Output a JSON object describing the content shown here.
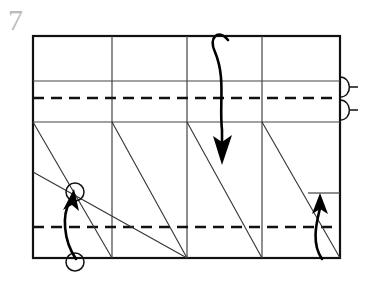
{
  "figure": {
    "step_number": "7",
    "canvas": {
      "width": 371,
      "height": 294,
      "background": "#ffffff"
    }
  },
  "colors": {
    "outline": "#111111",
    "crease_solid": "#444444",
    "crease_dashed": "#111111",
    "arrow": "#000000",
    "step_number": "#b9b9b9",
    "paper_fill": "#ffffff"
  },
  "paper": {
    "label": "paper-outline",
    "x": 33,
    "y": 36,
    "width": 307,
    "height": 222,
    "stroke_width": 2.2
  },
  "vertical_creases": {
    "label": "vertical-crease-lines",
    "x_positions": [
      112,
      187,
      262
    ],
    "y_top": 36,
    "y_bottom": 258,
    "stroke_width": 1.2
  },
  "horizontal_creases": [
    {
      "name": "upper-solid-crease",
      "y": 81,
      "x1": 33,
      "x2": 340,
      "style": "solid",
      "stroke_width": 1.2
    },
    {
      "name": "upper-dashed-crease",
      "y": 98,
      "x1": 33,
      "x2": 340,
      "style": "dashed",
      "stroke_width": 2.4,
      "dash": "10 7"
    },
    {
      "name": "lower-solid-crease",
      "y": 122,
      "x1": 33,
      "x2": 340,
      "style": "solid",
      "stroke_width": 1.2
    },
    {
      "name": "bottom-dashed-crease",
      "y": 227,
      "x1": 33,
      "x2": 340,
      "style": "dashed",
      "stroke_width": 2.4,
      "dash": "10 7"
    },
    {
      "name": "right-short-solid-crease",
      "y": 193,
      "x1": 308,
      "x2": 340,
      "style": "solid",
      "stroke_width": 1.2
    }
  ],
  "diagonal_creases": [
    {
      "name": "steep-diagonal-1",
      "x1": 33,
      "y1": 122,
      "x2": 112,
      "y2": 258
    },
    {
      "name": "steep-diagonal-2",
      "x1": 112,
      "y1": 122,
      "x2": 187,
      "y2": 258
    },
    {
      "name": "steep-diagonal-3",
      "x1": 187,
      "y1": 122,
      "x2": 262,
      "y2": 258
    },
    {
      "name": "steep-diagonal-4",
      "x1": 262,
      "y1": 122,
      "x2": 340,
      "y2": 258
    },
    {
      "name": "shallow-diagonal-left",
      "x1": 33,
      "y1": 172,
      "x2": 187,
      "y2": 258
    }
  ],
  "markers": {
    "reference_circles": [
      {
        "name": "reference-circle-upper",
        "cx": 75,
        "cy": 192,
        "r": 9
      },
      {
        "name": "reference-circle-lower",
        "cx": 75,
        "cy": 262,
        "r": 9
      }
    ],
    "pleat_hooks": [
      {
        "name": "pleat-hook-upper",
        "x": 340,
        "cy": 87,
        "rx": 9,
        "ry": 11,
        "tick_length": 7
      },
      {
        "name": "pleat-hook-lower",
        "x": 340,
        "cy": 110,
        "rx": 9,
        "ry": 11,
        "tick_length": 7
      }
    ]
  },
  "arrows": [
    {
      "name": "fold-down-arrow-center",
      "direction": "down",
      "description": "long curved arrow with loop at top, folding top layer down",
      "path": "M 231 42 C 222 30 212 38 217 50 C 225 72 221 100 223 128",
      "head": {
        "x": 223,
        "y": 158,
        "angle": 92
      }
    },
    {
      "name": "fold-up-arrow-left",
      "direction": "up",
      "description": "curved arrow from lower circle up to upper circle",
      "path": "M 75 258 C 64 238 63 214 71 200",
      "head": {
        "x": 74,
        "y": 193,
        "angle": -65
      }
    },
    {
      "name": "fold-up-arrow-right",
      "direction": "up",
      "description": "curved arrow at right side folding edge upward",
      "path": "M 322 258 C 312 240 319 218 320 206",
      "head": {
        "x": 320,
        "y": 196,
        "angle": -84
      }
    }
  ]
}
